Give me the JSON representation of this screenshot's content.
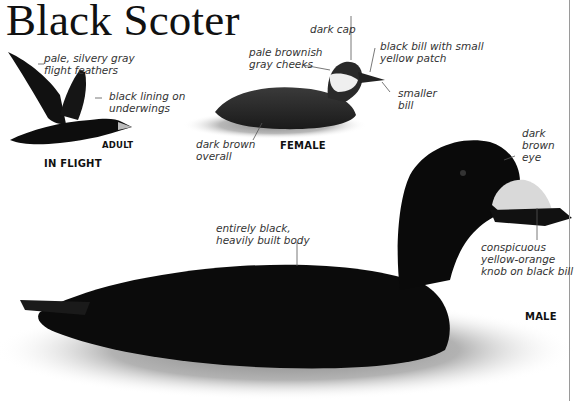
{
  "title": "Black Scoter",
  "in_flight": {
    "caption": "IN FLIGHT",
    "sub_caption": "ADULT",
    "labels": {
      "flight_feathers": [
        "pale, silvery gray",
        "flight feathers"
      ],
      "underwings": [
        "black lining on",
        "underwings"
      ]
    }
  },
  "female": {
    "caption": "FEMALE",
    "labels": {
      "cap": "dark cap",
      "cheeks": [
        "pale brownish",
        "gray cheeks"
      ],
      "bill": [
        "black bill with small",
        "yellow patch"
      ],
      "smaller_bill": [
        "smaller",
        "bill"
      ],
      "body": [
        "dark brown",
        "overall"
      ]
    }
  },
  "male": {
    "caption": "MALE",
    "labels": {
      "eye": [
        "dark",
        "brown",
        "eye"
      ],
      "body": [
        "entirely black,",
        "heavily built body"
      ],
      "knob": [
        "conspicuous",
        "yellow-orange",
        "knob on black bill"
      ]
    }
  },
  "colors": {
    "ink": "#111111",
    "label": "#333333",
    "leader_line": "#555555",
    "page_edge": "#9a9a9a",
    "bill_knob": "#d9d9d9"
  }
}
